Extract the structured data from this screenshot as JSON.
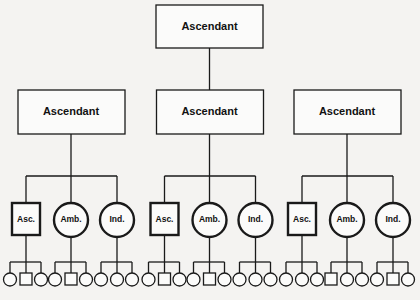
{
  "diagram": {
    "root": {
      "label": "Ascendant"
    },
    "branches": [
      {
        "label": "Ascendant",
        "children": [
          {
            "label": "Asc.",
            "shape": "square",
            "descendants": [
              "circle",
              "square",
              "circle"
            ]
          },
          {
            "label": "Amb.",
            "shape": "circle",
            "descendants": [
              "circle",
              "square",
              "circle"
            ]
          },
          {
            "label": "Ind.",
            "shape": "circle",
            "descendants": [
              "circle",
              "circle",
              "circle"
            ]
          }
        ]
      },
      {
        "label": "Ascendant",
        "children": [
          {
            "label": "Asc.",
            "shape": "square",
            "descendants": [
              "circle",
              "square",
              "circle"
            ]
          },
          {
            "label": "Amb.",
            "shape": "circle",
            "descendants": [
              "circle",
              "square",
              "circle"
            ]
          },
          {
            "label": "Ind.",
            "shape": "circle",
            "descendants": [
              "circle",
              "circle",
              "circle"
            ]
          }
        ]
      },
      {
        "label": "Ascendant",
        "children": [
          {
            "label": "Asc.",
            "shape": "square",
            "descendants": [
              "circle",
              "circle",
              "circle"
            ]
          },
          {
            "label": "Amb.",
            "shape": "circle",
            "descendants": [
              "square",
              "circle",
              "circle"
            ]
          },
          {
            "label": "Ind.",
            "shape": "circle",
            "descendants": [
              "circle",
              "square",
              "circle"
            ]
          }
        ]
      }
    ]
  }
}
